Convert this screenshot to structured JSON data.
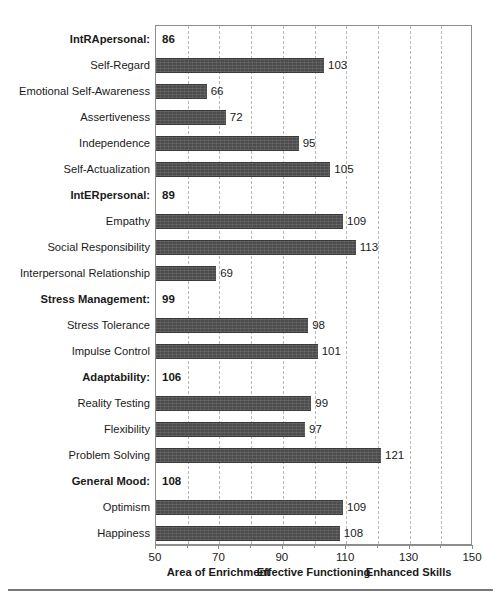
{
  "chart_data": {
    "type": "bar",
    "orientation": "horizontal",
    "title": "",
    "xlabel": "",
    "ylabel": "",
    "xlim": [
      50,
      150
    ],
    "grid": true,
    "gridlines": [
      60,
      70,
      80,
      90,
      100,
      110,
      120,
      130,
      140
    ],
    "tick_labels": [
      "50",
      "70",
      "90",
      "110",
      "130",
      "150"
    ],
    "tick_values": [
      50,
      70,
      90,
      110,
      130,
      150
    ],
    "zone_labels": [
      {
        "text": "Area of Enrichment",
        "center": 70
      },
      {
        "text": "Effective Functioning",
        "center": 100
      },
      {
        "text": "Enhanced Skills",
        "center": 130
      }
    ],
    "bar_color": "#4c4c4c",
    "rows": [
      {
        "label": "IntRApersonal:",
        "value": 86,
        "kind": "header"
      },
      {
        "label": "Self-Regard",
        "value": 103,
        "kind": "bar"
      },
      {
        "label": "Emotional Self-Awareness",
        "value": 66,
        "kind": "bar"
      },
      {
        "label": "Assertiveness",
        "value": 72,
        "kind": "bar"
      },
      {
        "label": "Independence",
        "value": 95,
        "kind": "bar"
      },
      {
        "label": "Self-Actualization",
        "value": 105,
        "kind": "bar"
      },
      {
        "label": "IntERpersonal:",
        "value": 89,
        "kind": "header"
      },
      {
        "label": "Empathy",
        "value": 109,
        "kind": "bar"
      },
      {
        "label": "Social Responsibility",
        "value": 113,
        "kind": "bar"
      },
      {
        "label": "Interpersonal Relationship",
        "value": 69,
        "kind": "bar"
      },
      {
        "label": "Stress Management:",
        "value": 99,
        "kind": "header"
      },
      {
        "label": "Stress Tolerance",
        "value": 98,
        "kind": "bar"
      },
      {
        "label": "Impulse Control",
        "value": 101,
        "kind": "bar"
      },
      {
        "label": "Adaptability:",
        "value": 106,
        "kind": "header"
      },
      {
        "label": "Reality Testing",
        "value": 99,
        "kind": "bar"
      },
      {
        "label": "Flexibility",
        "value": 97,
        "kind": "bar"
      },
      {
        "label": "Problem Solving",
        "value": 121,
        "kind": "bar"
      },
      {
        "label": "General Mood:",
        "value": 108,
        "kind": "header"
      },
      {
        "label": "Optimism",
        "value": 109,
        "kind": "bar"
      },
      {
        "label": "Happiness",
        "value": 108,
        "kind": "bar"
      }
    ]
  }
}
